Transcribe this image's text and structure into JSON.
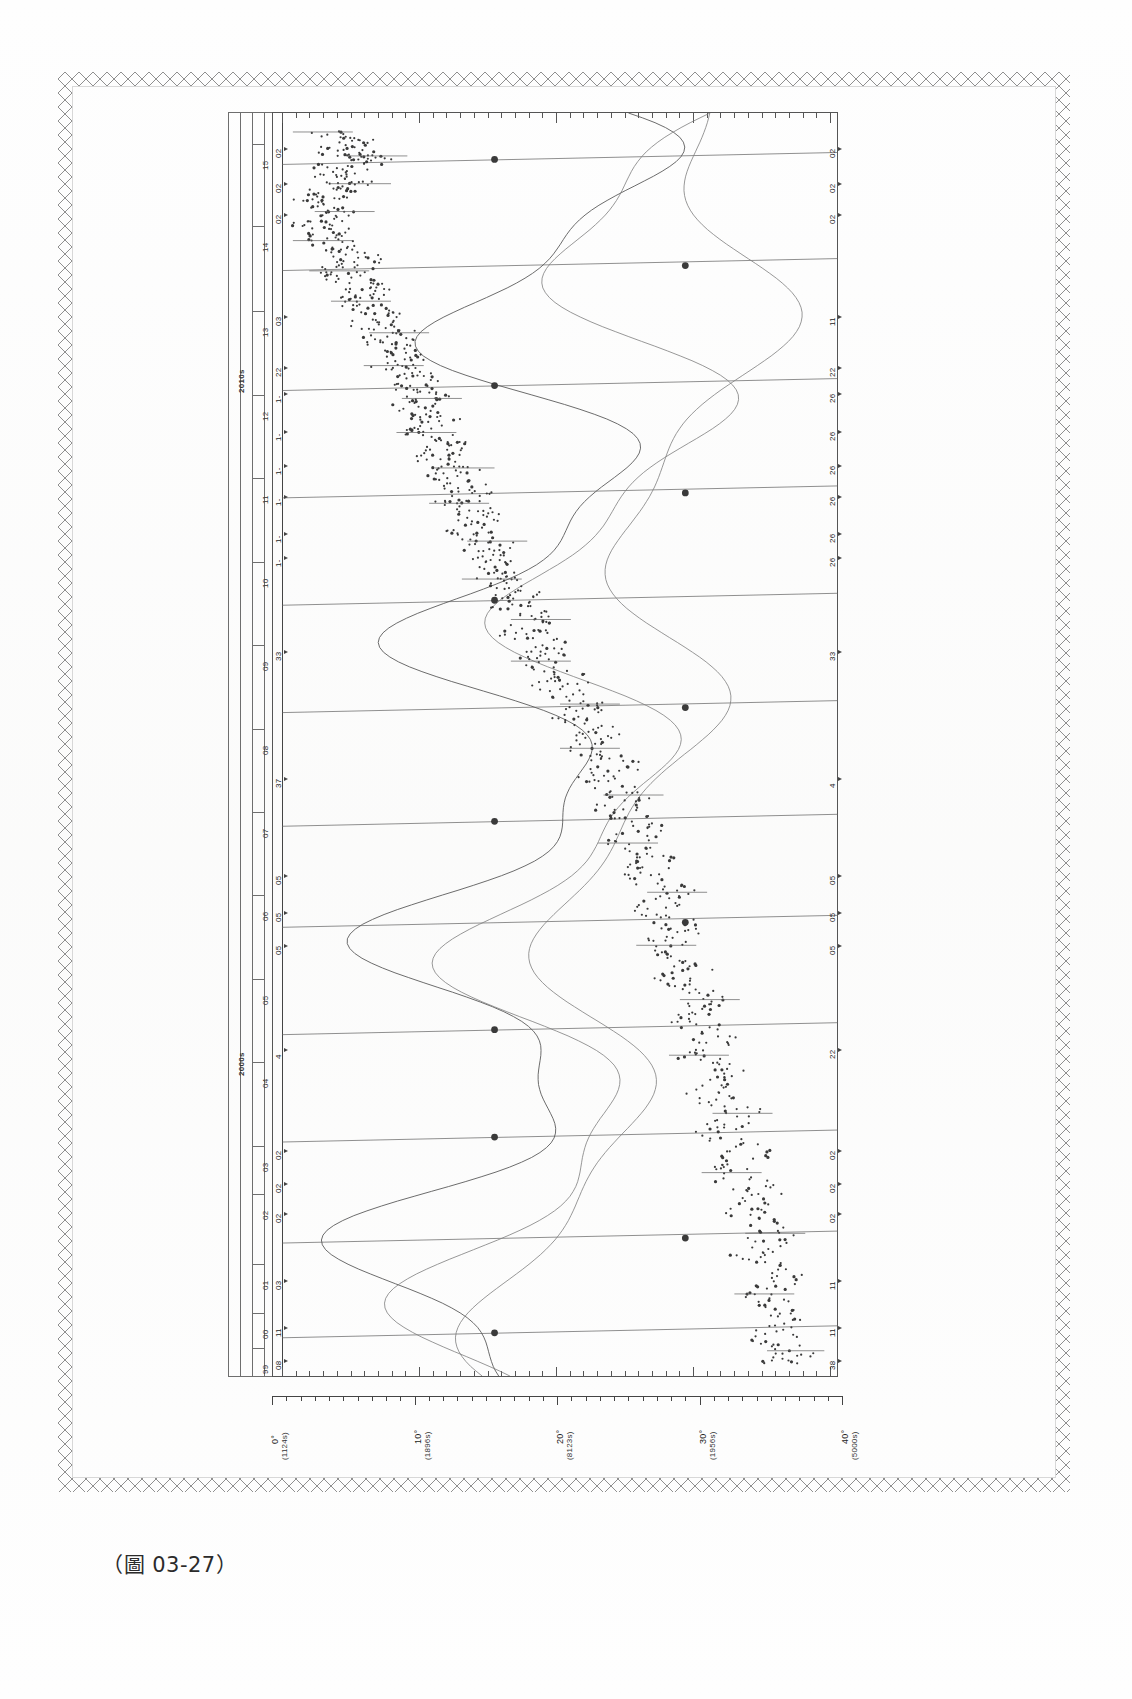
{
  "page": {
    "caption": "（圖 03-27）",
    "figure_number": "03-27",
    "background_color": "#ffffff",
    "ink_color": "#3a3a3a"
  },
  "figure": {
    "orientation": "rotated-90",
    "era_labels": [
      {
        "text": "2010s",
        "pos": 0.205
      },
      {
        "text": "2000s",
        "pos": 0.745
      }
    ],
    "year_labels": [
      {
        "text": "15",
        "pos": 0.038
      },
      {
        "text": "14",
        "pos": 0.103
      },
      {
        "text": "13",
        "pos": 0.17
      },
      {
        "text": "12",
        "pos": 0.236
      },
      {
        "text": "11",
        "pos": 0.302
      },
      {
        "text": "10",
        "pos": 0.368
      },
      {
        "text": "09",
        "pos": 0.434
      },
      {
        "text": "08",
        "pos": 0.5
      },
      {
        "text": "07",
        "pos": 0.566
      },
      {
        "text": "06",
        "pos": 0.632
      },
      {
        "text": "05",
        "pos": 0.698
      },
      {
        "text": "04",
        "pos": 0.764
      },
      {
        "text": "03",
        "pos": 0.83
      },
      {
        "text": "02",
        "pos": 0.868
      },
      {
        "text": "01",
        "pos": 0.923
      },
      {
        "text": "00",
        "pos": 0.962
      },
      {
        "text": "99",
        "pos": 0.99
      }
    ],
    "left_annotations": [
      {
        "text": "02",
        "pos": 0.03
      },
      {
        "text": "02",
        "pos": 0.058
      },
      {
        "text": "02",
        "pos": 0.082
      },
      {
        "text": "03",
        "pos": 0.163
      },
      {
        "text": "22",
        "pos": 0.203
      },
      {
        "text": "1-",
        "pos": 0.224
      },
      {
        "text": "1-",
        "pos": 0.254
      },
      {
        "text": "1-",
        "pos": 0.281
      },
      {
        "text": "1-",
        "pos": 0.305
      },
      {
        "text": "1-",
        "pos": 0.334
      },
      {
        "text": "1-",
        "pos": 0.353
      },
      {
        "text": "33",
        "pos": 0.428
      },
      {
        "text": "37",
        "pos": 0.528
      },
      {
        "text": "05",
        "pos": 0.605
      },
      {
        "text": "05",
        "pos": 0.634
      },
      {
        "text": "05",
        "pos": 0.66
      },
      {
        "text": "4",
        "pos": 0.742
      },
      {
        "text": "02",
        "pos": 0.822
      },
      {
        "text": "02",
        "pos": 0.848
      },
      {
        "text": "02",
        "pos": 0.872
      },
      {
        "text": "03",
        "pos": 0.925
      },
      {
        "text": "11",
        "pos": 0.962
      },
      {
        "text": "08",
        "pos": 0.988
      }
    ],
    "right_annotations": [
      {
        "text": "02",
        "pos": 0.03
      },
      {
        "text": "02",
        "pos": 0.058
      },
      {
        "text": "02",
        "pos": 0.082
      },
      {
        "text": "11",
        "pos": 0.163
      },
      {
        "text": "22",
        "pos": 0.203
      },
      {
        "text": "26",
        "pos": 0.224
      },
      {
        "text": "26",
        "pos": 0.254
      },
      {
        "text": "26",
        "pos": 0.281
      },
      {
        "text": "26",
        "pos": 0.305
      },
      {
        "text": "26",
        "pos": 0.334
      },
      {
        "text": "26",
        "pos": 0.353
      },
      {
        "text": "33",
        "pos": 0.428
      },
      {
        "text": "4",
        "pos": 0.528
      },
      {
        "text": "05",
        "pos": 0.605
      },
      {
        "text": "05",
        "pos": 0.634
      },
      {
        "text": "05",
        "pos": 0.66
      },
      {
        "text": "22",
        "pos": 0.742
      },
      {
        "text": "02",
        "pos": 0.822
      },
      {
        "text": "02",
        "pos": 0.848
      },
      {
        "text": "02",
        "pos": 0.872
      },
      {
        "text": "11",
        "pos": 0.925
      },
      {
        "text": "11",
        "pos": 0.962
      },
      {
        "text": "38",
        "pos": 0.988
      }
    ]
  },
  "chart_data": {
    "type": "scatter",
    "title": "",
    "subtitle": "",
    "xlabel": "",
    "ylabel": "",
    "grid": false,
    "legend_position": "none",
    "orientation": "vertical-time-axis",
    "axis_value": {
      "label": "",
      "ticks": [
        {
          "value": "0°",
          "sub": "(1124s)",
          "pos": 0.0
        },
        {
          "value": "10°",
          "sub": "(1896s)",
          "pos": 0.25
        },
        {
          "value": "20°",
          "sub": "(8123s)",
          "pos": 0.5
        },
        {
          "value": "30°",
          "sub": "(1956s)",
          "pos": 0.75
        },
        {
          "value": "40°",
          "sub": "(5000s)",
          "pos": 1.0
        }
      ],
      "minor_ticks_per_major": 10,
      "range": [
        "0°",
        "40°"
      ]
    },
    "axis_time": {
      "label": "",
      "eras": [
        "2010s",
        "2000s"
      ],
      "years": [
        "15",
        "14",
        "13",
        "12",
        "11",
        "10",
        "09",
        "08",
        "07",
        "06",
        "05",
        "04",
        "03",
        "02",
        "01",
        "00",
        "99"
      ],
      "range": [
        "1999",
        "2015"
      ]
    },
    "series": [
      {
        "name": "scatter-cloud",
        "marker": "dot",
        "color": "#3a3a3a",
        "description": "dense dotted trend descending from upper-left to lower-right",
        "points": [
          [
            0.07,
            0.015
          ],
          [
            0.13,
            0.022
          ],
          [
            0.1,
            0.03
          ],
          [
            0.17,
            0.034
          ],
          [
            0.12,
            0.041
          ],
          [
            0.08,
            0.049
          ],
          [
            0.14,
            0.056
          ],
          [
            0.09,
            0.063
          ],
          [
            0.06,
            0.071
          ],
          [
            0.11,
            0.078
          ],
          [
            0.05,
            0.086
          ],
          [
            0.09,
            0.094
          ],
          [
            0.07,
            0.101
          ],
          [
            0.12,
            0.109
          ],
          [
            0.15,
            0.117
          ],
          [
            0.1,
            0.125
          ],
          [
            0.13,
            0.133
          ],
          [
            0.17,
            0.141
          ],
          [
            0.14,
            0.149
          ],
          [
            0.19,
            0.157
          ],
          [
            0.16,
            0.166
          ],
          [
            0.21,
            0.174
          ],
          [
            0.18,
            0.183
          ],
          [
            0.23,
            0.191
          ],
          [
            0.2,
            0.2
          ],
          [
            0.25,
            0.208
          ],
          [
            0.22,
            0.217
          ],
          [
            0.27,
            0.226
          ],
          [
            0.24,
            0.235
          ],
          [
            0.29,
            0.244
          ],
          [
            0.26,
            0.253
          ],
          [
            0.31,
            0.262
          ],
          [
            0.28,
            0.271
          ],
          [
            0.33,
            0.281
          ],
          [
            0.3,
            0.29
          ],
          [
            0.35,
            0.3
          ],
          [
            0.32,
            0.309
          ],
          [
            0.37,
            0.319
          ],
          [
            0.34,
            0.329
          ],
          [
            0.39,
            0.339
          ],
          [
            0.36,
            0.349
          ],
          [
            0.41,
            0.359
          ],
          [
            0.38,
            0.369
          ],
          [
            0.44,
            0.38
          ],
          [
            0.41,
            0.39
          ],
          [
            0.47,
            0.401
          ],
          [
            0.44,
            0.412
          ],
          [
            0.5,
            0.423
          ],
          [
            0.47,
            0.434
          ],
          [
            0.53,
            0.445
          ],
          [
            0.5,
            0.456
          ],
          [
            0.56,
            0.468
          ],
          [
            0.53,
            0.479
          ],
          [
            0.59,
            0.491
          ],
          [
            0.56,
            0.503
          ],
          [
            0.62,
            0.515
          ],
          [
            0.58,
            0.527
          ],
          [
            0.64,
            0.54
          ],
          [
            0.61,
            0.552
          ],
          [
            0.67,
            0.565
          ],
          [
            0.63,
            0.578
          ],
          [
            0.69,
            0.591
          ],
          [
            0.66,
            0.604
          ],
          [
            0.72,
            0.617
          ],
          [
            0.68,
            0.631
          ],
          [
            0.74,
            0.645
          ],
          [
            0.7,
            0.659
          ],
          [
            0.76,
            0.673
          ],
          [
            0.72,
            0.687
          ],
          [
            0.78,
            0.702
          ],
          [
            0.74,
            0.716
          ],
          [
            0.8,
            0.731
          ],
          [
            0.76,
            0.746
          ],
          [
            0.82,
            0.761
          ],
          [
            0.78,
            0.776
          ],
          [
            0.84,
            0.792
          ],
          [
            0.8,
            0.807
          ],
          [
            0.86,
            0.823
          ],
          [
            0.82,
            0.839
          ],
          [
            0.88,
            0.855
          ],
          [
            0.84,
            0.871
          ],
          [
            0.9,
            0.887
          ],
          [
            0.86,
            0.903
          ],
          [
            0.92,
            0.919
          ],
          [
            0.88,
            0.935
          ],
          [
            0.93,
            0.951
          ],
          [
            0.89,
            0.966
          ],
          [
            0.94,
            0.98
          ],
          [
            0.9,
            0.992
          ]
        ]
      },
      {
        "name": "wave-curve-1",
        "marker": "line",
        "color": "#5b5b5b",
        "description": "smooth oscillating curve crossing the cloud"
      },
      {
        "name": "wave-curve-2",
        "marker": "line",
        "color": "#7d7d7d",
        "description": "second smooth oscillating curve, lower amplitude"
      },
      {
        "name": "event-markers",
        "marker": "filled-circle",
        "color": "#3a3a3a",
        "description": "large dots on the horizontal connector lines",
        "points": [
          [
            0.39,
            0.036
          ],
          [
            0.74,
            0.12
          ],
          [
            0.39,
            0.215
          ],
          [
            0.74,
            0.3
          ],
          [
            0.39,
            0.385
          ],
          [
            0.74,
            0.47
          ],
          [
            0.39,
            0.56
          ],
          [
            0.74,
            0.64
          ],
          [
            0.39,
            0.725
          ],
          [
            0.39,
            0.81
          ],
          [
            0.74,
            0.89
          ],
          [
            0.39,
            0.965
          ]
        ]
      }
    ]
  }
}
